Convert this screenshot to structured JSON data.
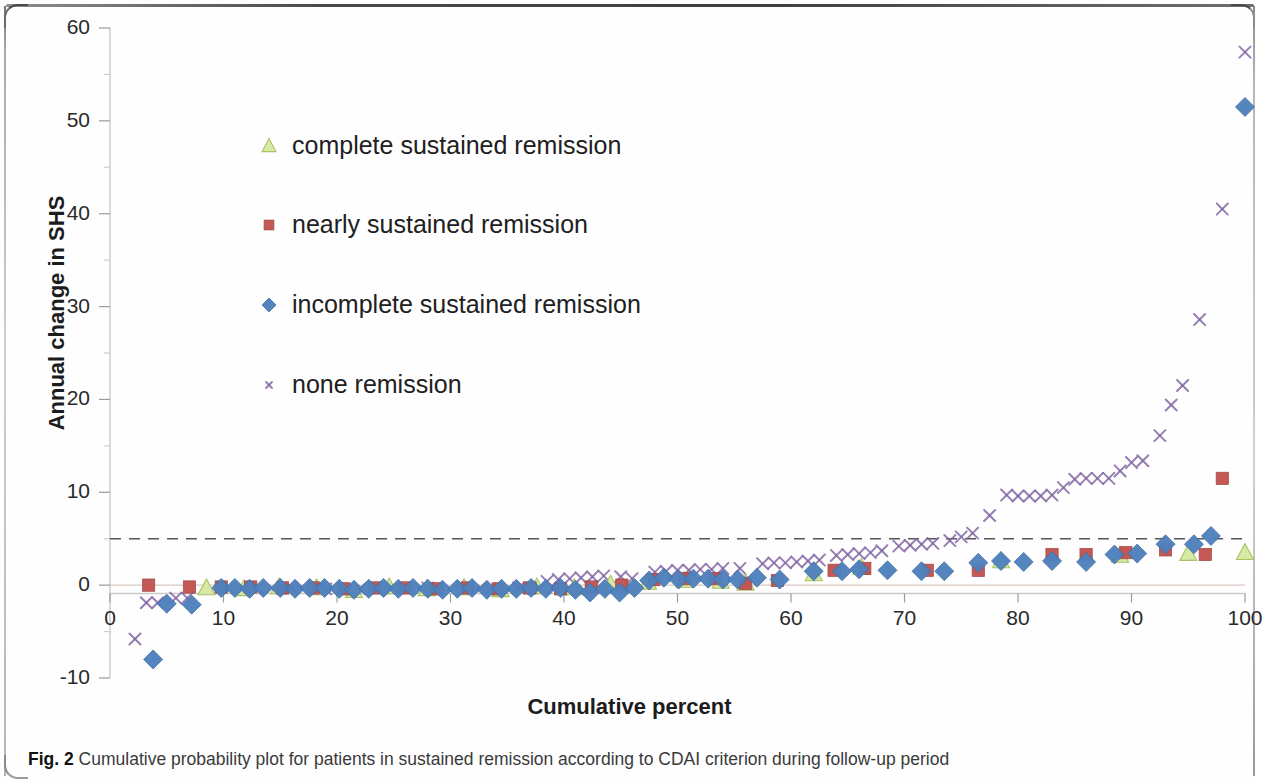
{
  "figure": {
    "caption_prefix": "Fig. 2",
    "caption_text": "Cumulative probability plot for patients in sustained remission according to CDAI criterion during follow-up period"
  },
  "chart_data": {
    "type": "scatter",
    "title": "",
    "xlabel": "Cumulative percent",
    "ylabel": "Annual change in SHS",
    "xlim": [
      0,
      100
    ],
    "ylim": [
      -10,
      60
    ],
    "xticks": [
      0,
      10,
      20,
      30,
      40,
      50,
      60,
      70,
      80,
      90,
      100
    ],
    "yticks": [
      -10,
      0,
      10,
      20,
      30,
      40,
      50,
      60
    ],
    "minor_tick_step": 5,
    "grid": false,
    "legend_position": "upper-left-inside",
    "reference_line": {
      "value": 5,
      "style": "dashed",
      "color": "#555555"
    },
    "colors": {
      "complete_sustained_remission": "#d5e8a0",
      "nearly_sustained_remission": "#c0504d",
      "incomplete_sustained_remission": "#4f81bd",
      "none_remission": "#8064a2"
    },
    "series": [
      {
        "name": "complete sustained remission",
        "marker": "triangle",
        "color": "#d5e8a0",
        "points": [
          [
            8.5,
            -0.3
          ],
          [
            11.8,
            -0.4
          ],
          [
            14.9,
            -0.2
          ],
          [
            18.2,
            -0.3
          ],
          [
            21.5,
            -0.6
          ],
          [
            24.6,
            -0.2
          ],
          [
            27.9,
            -0.4
          ],
          [
            31.2,
            -0.3
          ],
          [
            34.4,
            -0.5
          ],
          [
            37.6,
            -0.2
          ],
          [
            40.9,
            -0.3
          ],
          [
            44.1,
            0.1
          ],
          [
            47.4,
            0.3
          ],
          [
            50.6,
            0.5
          ],
          [
            53.8,
            0.4
          ],
          [
            56.0,
            0.2
          ],
          [
            62.0,
            1.2
          ],
          [
            66.2,
            1.9
          ],
          [
            78.5,
            2.6
          ],
          [
            89.0,
            3.2
          ],
          [
            95.0,
            3.4
          ],
          [
            100.0,
            3.5
          ]
        ]
      },
      {
        "name": "nearly sustained remission",
        "marker": "square",
        "color": "#c0504d",
        "points": [
          [
            3.4,
            0.0
          ],
          [
            7.0,
            -0.2
          ],
          [
            9.8,
            -0.2
          ],
          [
            12.4,
            -0.2
          ],
          [
            15.2,
            -0.3
          ],
          [
            17.9,
            -0.3
          ],
          [
            20.6,
            -0.4
          ],
          [
            23.3,
            -0.3
          ],
          [
            26.0,
            -0.3
          ],
          [
            28.8,
            -0.4
          ],
          [
            31.5,
            -0.3
          ],
          [
            34.2,
            -0.4
          ],
          [
            37.0,
            -0.3
          ],
          [
            39.7,
            -0.4
          ],
          [
            42.4,
            -0.2
          ],
          [
            45.1,
            0.0
          ],
          [
            47.9,
            0.6
          ],
          [
            50.6,
            0.7
          ],
          [
            53.3,
            0.7
          ],
          [
            56.0,
            0.2
          ],
          [
            58.8,
            0.5
          ],
          [
            63.8,
            1.6
          ],
          [
            66.5,
            1.8
          ],
          [
            72.0,
            1.6
          ],
          [
            76.5,
            1.6
          ],
          [
            83.0,
            3.3
          ],
          [
            86.0,
            3.3
          ],
          [
            89.5,
            3.5
          ],
          [
            93.0,
            3.8
          ],
          [
            96.5,
            3.3
          ],
          [
            98.0,
            11.5
          ]
        ]
      },
      {
        "name": "incomplete sustained remission",
        "marker": "diamond",
        "color": "#4f81bd",
        "points": [
          [
            3.8,
            -8.0
          ],
          [
            5.0,
            -2.0
          ],
          [
            7.2,
            -2.1
          ],
          [
            9.8,
            -0.3
          ],
          [
            11.0,
            -0.3
          ],
          [
            12.3,
            -0.4
          ],
          [
            13.5,
            -0.3
          ],
          [
            15.0,
            -0.3
          ],
          [
            16.3,
            -0.4
          ],
          [
            17.6,
            -0.3
          ],
          [
            18.9,
            -0.3
          ],
          [
            20.2,
            -0.4
          ],
          [
            21.5,
            -0.5
          ],
          [
            22.8,
            -0.4
          ],
          [
            24.1,
            -0.3
          ],
          [
            25.4,
            -0.4
          ],
          [
            26.7,
            -0.3
          ],
          [
            28.0,
            -0.4
          ],
          [
            29.3,
            -0.5
          ],
          [
            30.6,
            -0.4
          ],
          [
            31.9,
            -0.3
          ],
          [
            33.2,
            -0.5
          ],
          [
            34.5,
            -0.4
          ],
          [
            35.8,
            -0.4
          ],
          [
            37.1,
            -0.3
          ],
          [
            38.4,
            -0.4
          ],
          [
            39.7,
            -0.3
          ],
          [
            41.0,
            -0.5
          ],
          [
            42.3,
            -0.8
          ],
          [
            43.6,
            -0.4
          ],
          [
            44.9,
            -0.8
          ],
          [
            46.2,
            -0.3
          ],
          [
            47.5,
            0.5
          ],
          [
            48.8,
            0.8
          ],
          [
            50.1,
            0.6
          ],
          [
            51.4,
            0.7
          ],
          [
            52.7,
            0.7
          ],
          [
            54.0,
            0.6
          ],
          [
            55.3,
            0.6
          ],
          [
            57.0,
            0.8
          ],
          [
            59.0,
            0.6
          ],
          [
            62.0,
            1.5
          ],
          [
            64.5,
            1.5
          ],
          [
            66.0,
            1.7
          ],
          [
            68.5,
            1.6
          ],
          [
            71.5,
            1.5
          ],
          [
            73.5,
            1.5
          ],
          [
            76.5,
            2.4
          ],
          [
            78.5,
            2.6
          ],
          [
            80.5,
            2.5
          ],
          [
            83.0,
            2.6
          ],
          [
            86.0,
            2.5
          ],
          [
            88.5,
            3.3
          ],
          [
            90.5,
            3.4
          ],
          [
            93.0,
            4.4
          ],
          [
            95.5,
            4.4
          ],
          [
            97.0,
            5.3
          ],
          [
            100.0,
            51.5
          ]
        ]
      },
      {
        "name": "none remission",
        "marker": "cross",
        "color": "#8064a2",
        "points": [
          [
            2.2,
            -5.8
          ],
          [
            3.2,
            -1.9
          ],
          [
            4.2,
            -1.9
          ],
          [
            5.8,
            -1.4
          ],
          [
            6.8,
            -1.4
          ],
          [
            10.5,
            -0.3
          ],
          [
            13.0,
            -0.3
          ],
          [
            16.0,
            -0.3
          ],
          [
            19.0,
            -0.4
          ],
          [
            22.0,
            -0.4
          ],
          [
            25.0,
            -0.3
          ],
          [
            28.0,
            -0.3
          ],
          [
            31.0,
            -0.4
          ],
          [
            33.5,
            -0.4
          ],
          [
            36.0,
            -0.3
          ],
          [
            38.5,
            0.4
          ],
          [
            39.5,
            0.6
          ],
          [
            40.5,
            0.7
          ],
          [
            41.5,
            0.8
          ],
          [
            42.5,
            0.9
          ],
          [
            43.5,
            1.0
          ],
          [
            45.0,
            0.9
          ],
          [
            46.0,
            0.7
          ],
          [
            48.0,
            1.4
          ],
          [
            49.0,
            1.5
          ],
          [
            50.0,
            1.6
          ],
          [
            51.0,
            1.6
          ],
          [
            52.0,
            1.7
          ],
          [
            53.0,
            1.7
          ],
          [
            54.0,
            1.8
          ],
          [
            55.5,
            1.8
          ],
          [
            57.5,
            2.3
          ],
          [
            58.5,
            2.4
          ],
          [
            59.5,
            2.4
          ],
          [
            60.5,
            2.5
          ],
          [
            61.5,
            2.6
          ],
          [
            62.5,
            2.7
          ],
          [
            64.0,
            3.2
          ],
          [
            65.0,
            3.3
          ],
          [
            66.0,
            3.4
          ],
          [
            67.0,
            3.5
          ],
          [
            68.0,
            3.7
          ],
          [
            69.5,
            4.2
          ],
          [
            70.5,
            4.3
          ],
          [
            71.5,
            4.4
          ],
          [
            72.5,
            4.5
          ],
          [
            74.0,
            4.8
          ],
          [
            75.0,
            5.2
          ],
          [
            76.0,
            5.6
          ],
          [
            77.5,
            7.5
          ],
          [
            79.0,
            9.7
          ],
          [
            80.0,
            9.6
          ],
          [
            81.0,
            9.6
          ],
          [
            82.0,
            9.6
          ],
          [
            83.0,
            9.7
          ],
          [
            84.0,
            10.5
          ],
          [
            85.0,
            11.4
          ],
          [
            86.0,
            11.5
          ],
          [
            87.0,
            11.5
          ],
          [
            88.0,
            11.5
          ],
          [
            89.0,
            12.3
          ],
          [
            90.0,
            13.2
          ],
          [
            91.0,
            13.4
          ],
          [
            92.5,
            16.1
          ],
          [
            93.5,
            19.4
          ],
          [
            94.5,
            21.5
          ],
          [
            96.0,
            28.6
          ],
          [
            98.0,
            40.5
          ],
          [
            100.0,
            57.4
          ]
        ]
      }
    ],
    "legend": [
      {
        "label": "complete sustained remission",
        "marker": "triangle",
        "color": "#d5e8a0"
      },
      {
        "label": "nearly sustained remission",
        "marker": "square",
        "color": "#c0504d"
      },
      {
        "label": "incomplete sustained remission",
        "marker": "diamond",
        "color": "#4f81bd"
      },
      {
        "label": "none remission",
        "marker": "cross",
        "color": "#8064a2"
      }
    ]
  }
}
